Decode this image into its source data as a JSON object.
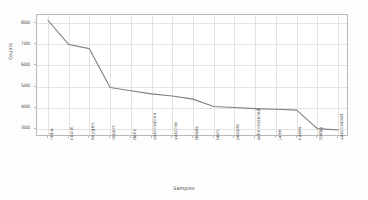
{
  "chart_data": {
    "type": "line",
    "title": "",
    "xlabel": "Samples",
    "ylabel": "Counts",
    "grid": true,
    "legend": null,
    "ylim": [
      260,
      840
    ],
    "yticks": [
      300,
      400,
      500,
      600,
      700,
      800
    ],
    "categories": [
      "india",
      "covid",
      "oxygen",
      "report",
      "delhi",
      "vaccination",
      "vaccine",
      "doses",
      "lakh",
      "people",
      "administered",
      "june",
      "cases",
      "today",
      "vaccinated"
    ],
    "values": [
      815,
      700,
      680,
      495,
      480,
      465,
      455,
      440,
      405,
      400,
      395,
      392,
      388,
      300,
      293
    ],
    "series": [
      {
        "name": "Counts",
        "color": "#7f7f7f",
        "values": [
          815,
          700,
          680,
          495,
          480,
          465,
          455,
          440,
          405,
          400,
          395,
          392,
          388,
          300,
          293
        ]
      }
    ]
  },
  "style": {
    "line_color": "#808080",
    "grid_color": "#e3e3e3",
    "frame_color": "#b9b9b9",
    "tick_text_color": "#4a4a4a",
    "axis_label_color": "#3f3f3f",
    "figure_background": "#fdfdfd",
    "axes_background": "#ffffff"
  }
}
